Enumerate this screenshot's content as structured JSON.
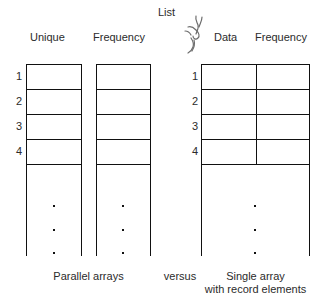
{
  "figure": {
    "title_label": "List",
    "annotation_mark": "handwritten-squiggle"
  },
  "parallel_arrays": {
    "headers": {
      "unique": "Unique",
      "frequency": "Frequency"
    },
    "row_numbers": [
      "1",
      "2",
      "3",
      "4"
    ],
    "caption": "Parallel arrays"
  },
  "separator": {
    "label": "versus"
  },
  "single_array": {
    "headers": {
      "data": "Data",
      "frequency": "Frequency"
    },
    "row_numbers": [
      "1",
      "2",
      "3",
      "4"
    ],
    "caption_line1": "Single array",
    "caption_line2": "with record elements"
  },
  "style": {
    "stroke": "#111111",
    "text": "#2b2b2b",
    "background": "#ffffff"
  }
}
